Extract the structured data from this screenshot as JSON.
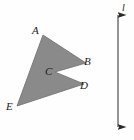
{
  "figure": {
    "background_color": "#fefefe",
    "shape": {
      "name": "shaded-polygon",
      "fill_color": "#8a8a8a",
      "stroke_color": "#6f6f6f",
      "type": "concave-polygon",
      "vertex_count": 5,
      "points": "43,35 86,63 55,72 84,84 17,106",
      "vertices": [
        {
          "id": "A",
          "label": "A",
          "x": 43,
          "y": 35
        },
        {
          "id": "B",
          "label": "B",
          "x": 86,
          "y": 63
        },
        {
          "id": "C",
          "label": "C",
          "x": 55,
          "y": 72
        },
        {
          "id": "D",
          "label": "D",
          "x": 84,
          "y": 84
        },
        {
          "id": "E",
          "label": "E",
          "x": 17,
          "y": 106
        }
      ]
    },
    "line": {
      "name": "vertical-axis-line",
      "label": "l",
      "stroke_color": "#2a2a2a",
      "x": 118,
      "y_top": 14,
      "y_bottom": 128,
      "arrowheads": "both"
    }
  }
}
